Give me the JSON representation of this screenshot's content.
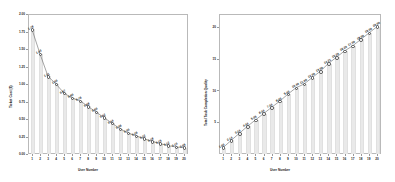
{
  "figure": {
    "background": "#ffffff",
    "bar_color": "#e9e9e9",
    "line_color": "#4a4a4a",
    "frame_color": "#b9b9b9",
    "panel_count": 2
  },
  "chart_data": [
    {
      "type": "bar",
      "panel": "left",
      "title": "",
      "xlabel": "User Number",
      "ylabel": "Ticket Cost ($)",
      "grid": false,
      "legend": null,
      "xlim": [
        0.4,
        20.6
      ],
      "ylim": [
        0.0,
        2.0
      ],
      "yticks": [
        0.0,
        0.25,
        0.5,
        0.75,
        1.0,
        1.25,
        1.5,
        1.75,
        2.0
      ],
      "ytick_labels": [
        "0.00",
        "0.25",
        "0.50",
        "0.75",
        "1.00",
        "1.25",
        "1.50",
        "1.75",
        "2.00"
      ],
      "categories": [
        1,
        2,
        3,
        4,
        5,
        6,
        7,
        8,
        9,
        10,
        11,
        12,
        13,
        14,
        15,
        16,
        17,
        18,
        19,
        20
      ],
      "xtick_labels": [
        "1",
        "2",
        "3",
        "4",
        "5",
        "6",
        "7",
        "8",
        "9",
        "10",
        "11",
        "12",
        "13",
        "14",
        "15",
        "16",
        "17",
        "18",
        "19",
        "20"
      ],
      "values": [
        1.78,
        1.43,
        1.11,
        1.0,
        0.87,
        0.8,
        0.76,
        0.68,
        0.6,
        0.52,
        0.44,
        0.36,
        0.3,
        0.26,
        0.22,
        0.18,
        0.15,
        0.12,
        0.1,
        0.09
      ],
      "data_labels": [
        "1.78",
        "1.43",
        "1.11",
        "1.00",
        "0.87",
        "0.80",
        "0.76",
        "0.68",
        "0.60",
        "0.52",
        "0.44",
        "0.36",
        "0.30",
        "0.26",
        "0.22",
        "0.18",
        "0.15",
        "0.12",
        "0.10",
        "0.09"
      ],
      "overlay": "line-with-markers"
    },
    {
      "type": "bar",
      "panel": "right",
      "title": "",
      "xlabel": "User Number",
      "ylabel": "Total Task Completion Quality",
      "grid": false,
      "legend": null,
      "xlim": [
        0.4,
        20.6
      ],
      "ylim": [
        0.0,
        22.0
      ],
      "yticks": [
        5,
        10,
        15,
        20
      ],
      "ytick_labels": [
        "5",
        "10",
        "15",
        "20"
      ],
      "categories": [
        1,
        2,
        3,
        4,
        5,
        6,
        7,
        8,
        9,
        10,
        11,
        12,
        13,
        14,
        15,
        16,
        17,
        18,
        19,
        20
      ],
      "xtick_labels": [
        "1",
        "2",
        "3",
        "4",
        "5",
        "6",
        "7",
        "8",
        "9",
        "10",
        "11",
        "12",
        "13",
        "14",
        "15",
        "16",
        "17",
        "18",
        "19",
        "20"
      ],
      "values": [
        1.0,
        2.14,
        3.24,
        4.34,
        5.35,
        6.34,
        7.34,
        8.3,
        9.4,
        10.4,
        11.0,
        12.0,
        13.0,
        14.21,
        15.2,
        16.2,
        17.0,
        18.0,
        19.0,
        20.0
      ],
      "data_labels": [
        "1.00",
        "2.14",
        "3.24",
        "4.34",
        "5.35",
        "6.34",
        "7.34",
        "8.30",
        "9.40",
        "10.40",
        "11.00",
        "12.00",
        "13.00",
        "14.21",
        "15.20",
        "16.20",
        "17.00",
        "18.00",
        "19.00",
        "20.00"
      ],
      "overlay": "line-with-markers"
    }
  ]
}
